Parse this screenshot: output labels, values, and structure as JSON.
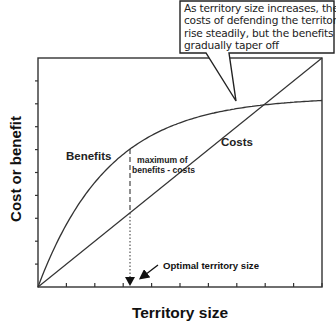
{
  "callout": {
    "lines": [
      "As territory size increases, the",
      "costs of defending the territory",
      "rise steadily, but the benefits",
      "gradually taper off"
    ]
  },
  "labels": {
    "benefits": "Benefits",
    "costs": "Costs",
    "maximum_line1": "maximum of",
    "maximum_line2": "benefits - costs",
    "optimal": "Optimal territory size"
  },
  "axes": {
    "xlabel": "Territory size",
    "ylabel": "Cost or benefit"
  },
  "colors": {
    "line": "#222222",
    "text": "#111111"
  },
  "chart_data": {
    "type": "line",
    "title": "",
    "xlabel": "Territory size",
    "ylabel": "Cost or benefit",
    "x_ticks": 10,
    "y_ticks": 10,
    "xlim": [
      0,
      10
    ],
    "ylim": [
      0,
      10
    ],
    "grid": false,
    "series": [
      {
        "name": "Benefits",
        "shape": "saturating curve (1 - e^-kx)",
        "x": [
          0,
          1,
          2,
          3,
          3.2,
          4,
          5,
          6,
          7,
          8,
          9,
          10
        ],
        "values": [
          0,
          2.9,
          5.0,
          6.1,
          6.0,
          6.9,
          7.5,
          7.8,
          8.0,
          8.1,
          8.1,
          8.1
        ]
      },
      {
        "name": "Costs",
        "shape": "straight line from origin",
        "x": [
          0,
          10
        ],
        "values": [
          0,
          10
        ]
      }
    ],
    "annotations": [
      {
        "text": "maximum of benefits - costs",
        "x": 3.2
      },
      {
        "text": "Optimal territory size",
        "x": 3.2,
        "arrow_to_axis": true
      },
      {
        "text": "As territory size increases, the costs of defending the territory rise steadily, but the benefits gradually taper off",
        "type": "callout"
      }
    ]
  }
}
